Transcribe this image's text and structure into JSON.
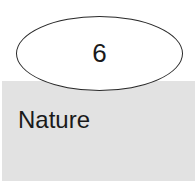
{
  "node": {
    "number": "6",
    "label": "Nature"
  },
  "colors": {
    "band": "#e2e2e2",
    "outline": "#2a2a2a",
    "text": "#1a1a1a"
  }
}
